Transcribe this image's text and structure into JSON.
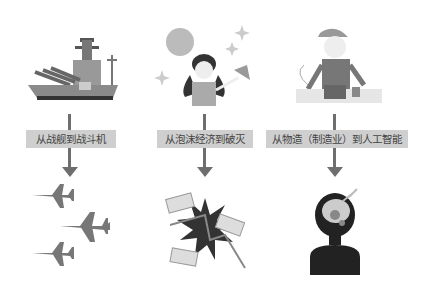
{
  "columns": [
    {
      "label": "从战舰到战斗机",
      "top_image": "battleship-icon",
      "bottom_image": "fighter-jets-icon"
    },
    {
      "label": "从泡沫经济到破灭",
      "top_image": "disco-woman-icon",
      "bottom_image": "money-crash-icon"
    },
    {
      "label": "从物造（制造业）到人工智能",
      "top_image": "factory-worker-icon",
      "bottom_image": "ai-head-icon"
    }
  ],
  "colors": {
    "arrow": "#6e6e6e",
    "label_bg": "#cfcfcf",
    "label_text": "#444444"
  }
}
